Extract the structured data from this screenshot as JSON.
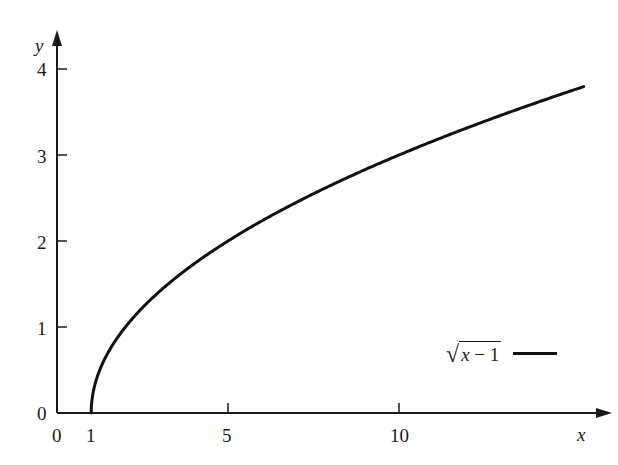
{
  "chart_data": {
    "type": "line",
    "title": "",
    "xlabel": "x",
    "ylabel": "y",
    "xlim": [
      0,
      15.4
    ],
    "ylim": [
      0,
      4.2
    ],
    "x_ticks": [
      0,
      1,
      5,
      10
    ],
    "x_tick_labels": [
      "0",
      "1",
      "5",
      "10"
    ],
    "y_ticks": [
      0,
      1,
      2,
      3,
      4
    ],
    "y_tick_labels": [
      "0",
      "1",
      "2",
      "3",
      "4"
    ],
    "grid": false,
    "legend_position": "lower right",
    "series": [
      {
        "name": "√(x − 1)",
        "function": "sqrt(x - 1)",
        "x": [
          1,
          1.25,
          1.5,
          2,
          3,
          4,
          5,
          6,
          7,
          8,
          9,
          10,
          11,
          12,
          13,
          14,
          15,
          15.4
        ],
        "y": [
          0,
          0.5,
          0.71,
          1.0,
          1.41,
          1.73,
          2.0,
          2.24,
          2.45,
          2.65,
          2.83,
          3.0,
          3.16,
          3.32,
          3.46,
          3.61,
          3.74,
          3.79
        ],
        "color": "#111111"
      }
    ]
  },
  "axes": {
    "x_label": "x",
    "y_label": "y",
    "origin_y_label": "0",
    "x_tick_labels": [
      "0",
      "1",
      "5",
      "10"
    ],
    "y_tick_labels": [
      "1",
      "2",
      "3",
      "4"
    ]
  },
  "legend": {
    "radical_symbol": "√",
    "radicand_var": "x",
    "radicand_rest": " − 1"
  },
  "colors": {
    "axis": "#1a1a1a",
    "curve": "#111111",
    "background": "#ffffff"
  }
}
